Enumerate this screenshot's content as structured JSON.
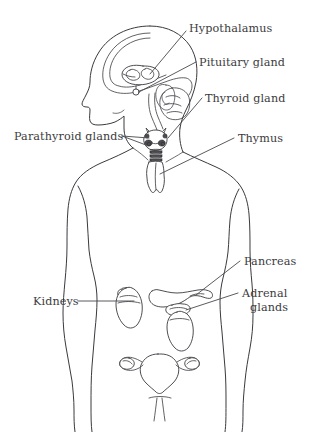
{
  "figure": {
    "background_color": "#ffffff",
    "line_color": "#3a3a3e",
    "text_color": "#3b3b40"
  },
  "labels": {
    "hypothalamus": "Hypothalamus",
    "pituitary_gland": "Pituitary gland",
    "thyroid_gland": "Thyroid gland",
    "thymus": "Thymus",
    "parathyroid_glands": "Parathyroid glands",
    "pancreas": "Pancreas",
    "adrenal_line1": "Adrenal",
    "adrenal_line2": "glands",
    "kidneys": "Kidneys"
  },
  "label_list": [
    {
      "id": "hypothalamus",
      "text": "Hypothalamus",
      "anchor": "start",
      "x": 189,
      "y": 32,
      "side": "right"
    },
    {
      "id": "pituitary-gland",
      "text": "Pituitary gland",
      "anchor": "start",
      "x": 199,
      "y": 63,
      "side": "right"
    },
    {
      "id": "thyroid-gland",
      "text": "Thyroid gland",
      "anchor": "start",
      "x": 205,
      "y": 103,
      "side": "right"
    },
    {
      "id": "thymus",
      "text": "Thymus",
      "anchor": "start",
      "x": 237,
      "y": 141,
      "side": "right"
    },
    {
      "id": "parathyroid-glands",
      "text": "Parathyroid glands",
      "anchor": "start",
      "x": 15,
      "y": 139,
      "side": "left"
    },
    {
      "id": "pancreas",
      "text": "Pancreas",
      "anchor": "start",
      "x": 243,
      "y": 264,
      "side": "right"
    },
    {
      "id": "adrenal-glands",
      "text": "Adrenal glands",
      "anchor": "start",
      "x": 241,
      "y": 295,
      "side": "right"
    },
    {
      "id": "kidneys",
      "text": "Kidneys",
      "anchor": "start",
      "x": 34,
      "y": 301,
      "side": "left"
    }
  ],
  "organs": [
    {
      "id": "brain",
      "name": "brain"
    },
    {
      "id": "hypothalamus",
      "name": "hypothalamus"
    },
    {
      "id": "pituitary-gland",
      "name": "pituitary-gland"
    },
    {
      "id": "thyroid-gland",
      "name": "thyroid-gland"
    },
    {
      "id": "parathyroid-glands",
      "name": "parathyroid-glands"
    },
    {
      "id": "thymus",
      "name": "thymus"
    },
    {
      "id": "pancreas",
      "name": "pancreas"
    },
    {
      "id": "adrenal-glands",
      "name": "adrenal-glands"
    },
    {
      "id": "kidneys",
      "name": "kidneys"
    },
    {
      "id": "uterus-ovaries",
      "name": "uterus-ovaries"
    }
  ]
}
